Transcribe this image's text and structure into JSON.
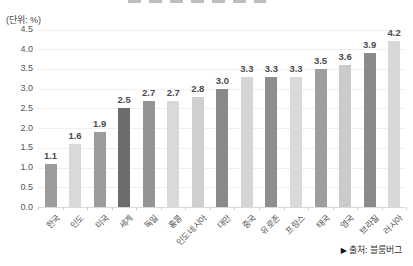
{
  "unit_label": "(단위: %)",
  "source": {
    "arrow_icon": "▶",
    "text": "출처: 블룸버그"
  },
  "colors": {
    "background": "#ffffff",
    "gridline": "#efefef",
    "baseline": "#d9d9d9",
    "value_label": "#4a4a4a",
    "axis_label": "#555555",
    "bar_colors": [
      "#9c9c9c",
      "#d9d9d9",
      "#9c9c9c",
      "#6d6d6d",
      "#949494",
      "#d9d9d9",
      "#cfcfcf",
      "#898989",
      "#d5d5d5",
      "#8e8e8e",
      "#dadada",
      "#9e9e9e",
      "#cbcbcb",
      "#8a8a8a",
      "#d8d8d8"
    ]
  },
  "chart_data": {
    "type": "bar",
    "categories": [
      "한국",
      "인도",
      "미국",
      "세계",
      "독일",
      "홍콩",
      "인도네시아",
      "대만",
      "중국",
      "유로존",
      "프랑스",
      "태국",
      "영국",
      "브라질",
      "러시아"
    ],
    "values": [
      1.1,
      1.6,
      1.9,
      2.5,
      2.7,
      2.7,
      2.8,
      3.0,
      3.3,
      3.3,
      3.3,
      3.5,
      3.6,
      3.9,
      4.2
    ],
    "value_labels": [
      "1.1",
      "1.6",
      "1.9",
      "2.5",
      "2.7",
      "2.7",
      "2.8",
      "3.0",
      "3.3",
      "3.3",
      "3.3",
      "3.5",
      "3.6",
      "3.9",
      "4.2"
    ],
    "title": "",
    "xlabel": "",
    "ylabel": "(단위: %)",
    "ylim": [
      0,
      4.5
    ],
    "y_ticks": [
      "0.0",
      "0.5",
      "1.0",
      "1.5",
      "2.0",
      "2.5",
      "3.0",
      "3.5",
      "4.0",
      "4.5"
    ],
    "grid": true,
    "legend": false,
    "highlighted_category": "세계",
    "source_note": "▶ 출처: 블룸버그"
  }
}
